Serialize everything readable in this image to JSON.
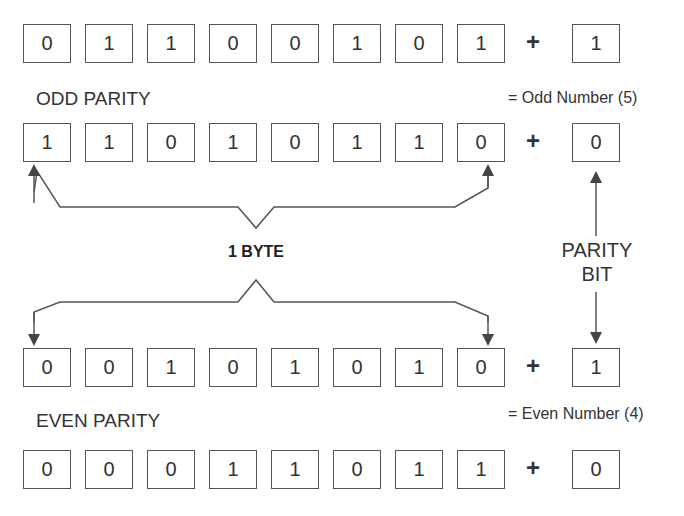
{
  "rows": [
    {
      "bits": [
        "0",
        "1",
        "1",
        "0",
        "0",
        "1",
        "0",
        "1"
      ],
      "operator": "+",
      "parity_bit": "1"
    },
    {
      "bits": [
        "1",
        "1",
        "0",
        "1",
        "0",
        "1",
        "1",
        "0"
      ],
      "operator": "+",
      "parity_bit": "0"
    },
    {
      "bits": [
        "0",
        "0",
        "1",
        "0",
        "1",
        "0",
        "1",
        "0"
      ],
      "operator": "+",
      "parity_bit": "1"
    },
    {
      "bits": [
        "0",
        "0",
        "0",
        "1",
        "1",
        "0",
        "1",
        "1"
      ],
      "operator": "+",
      "parity_bit": "0"
    }
  ],
  "labels": {
    "odd_parity": "ODD PARITY",
    "odd_note": "= Odd Number (5)",
    "even_parity": "EVEN PARITY",
    "even_note": "= Even Number (4)",
    "byte": "1 BYTE",
    "parity_bit_line1": "PARITY",
    "parity_bit_line2": "BIT"
  }
}
